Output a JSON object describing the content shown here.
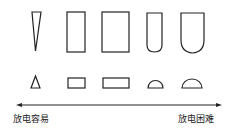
{
  "diagram": {
    "top_row": [
      "needle-triangle",
      "narrow-rectangle",
      "wide-rectangle",
      "narrow-rounded-bottom",
      "wide-rounded-bottom"
    ],
    "bottom_row": [
      "small-triangle",
      "small-rectangle",
      "long-rectangle",
      "small-semicircle",
      "large-semicircle"
    ],
    "axis": {
      "direction": "double-arrow",
      "left_label": "放电容易",
      "right_label": "放电困难"
    },
    "stroke_color": "#222222"
  }
}
